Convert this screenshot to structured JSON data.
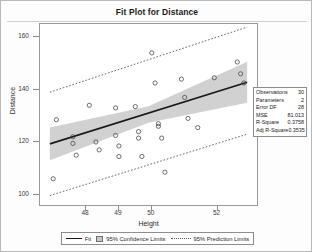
{
  "chart_data": {
    "type": "scatter",
    "title": "Fit Plot for Distance",
    "xlabel": "Height",
    "ylabel": "Distance",
    "xlim": [
      46.6,
      53.2
    ],
    "ylim": [
      96,
      165
    ],
    "xticks": [
      48,
      49,
      50,
      52
    ],
    "yticks": [
      100,
      120,
      140,
      160
    ],
    "grid": false,
    "legend_position": "bottom",
    "series": [
      {
        "name": "Observations",
        "type": "scatter",
        "marker": "open-circle",
        "points": [
          {
            "x": 47.0,
            "y": 106.0
          },
          {
            "x": 47.1,
            "y": 128.5
          },
          {
            "x": 47.6,
            "y": 122.0
          },
          {
            "x": 47.6,
            "y": 119.5
          },
          {
            "x": 47.7,
            "y": 115.0
          },
          {
            "x": 48.1,
            "y": 134.0
          },
          {
            "x": 48.3,
            "y": 120.0
          },
          {
            "x": 48.4,
            "y": 117.0
          },
          {
            "x": 48.9,
            "y": 133.0
          },
          {
            "x": 48.9,
            "y": 122.5
          },
          {
            "x": 49.0,
            "y": 118.5
          },
          {
            "x": 49.0,
            "y": 114.5
          },
          {
            "x": 49.5,
            "y": 133.5
          },
          {
            "x": 49.6,
            "y": 124.0
          },
          {
            "x": 49.6,
            "y": 121.5
          },
          {
            "x": 49.7,
            "y": 114.5
          },
          {
            "x": 50.0,
            "y": 154.0
          },
          {
            "x": 50.1,
            "y": 142.5
          },
          {
            "x": 50.2,
            "y": 127.0
          },
          {
            "x": 50.2,
            "y": 126.0
          },
          {
            "x": 50.3,
            "y": 121.5
          },
          {
            "x": 50.4,
            "y": 108.5
          },
          {
            "x": 50.9,
            "y": 144.0
          },
          {
            "x": 51.0,
            "y": 137.0
          },
          {
            "x": 51.1,
            "y": 129.0
          },
          {
            "x": 51.4,
            "y": 125.5
          },
          {
            "x": 51.9,
            "y": 144.5
          },
          {
            "x": 52.6,
            "y": 150.5
          },
          {
            "x": 52.7,
            "y": 146.0
          },
          {
            "x": 52.8,
            "y": 142.5
          }
        ]
      },
      {
        "name": "Fit",
        "type": "line",
        "style": "solid",
        "points": [
          {
            "x": 46.9,
            "y": 119.3
          },
          {
            "x": 52.9,
            "y": 142.8
          }
        ]
      },
      {
        "name": "95% Confidence Limits",
        "type": "band",
        "upper": [
          {
            "x": 46.9,
            "y": 125.5
          },
          {
            "x": 49.9,
            "y": 133.6
          },
          {
            "x": 52.9,
            "y": 150.6
          }
        ],
        "lower": [
          {
            "x": 46.9,
            "y": 113.1
          },
          {
            "x": 49.9,
            "y": 127.4
          },
          {
            "x": 52.9,
            "y": 135.0
          }
        ]
      },
      {
        "name": "95% Prediction Limits",
        "type": "band-lines",
        "style": "dotted",
        "upper": [
          {
            "x": 46.9,
            "y": 139.0
          },
          {
            "x": 52.9,
            "y": 163.8
          }
        ],
        "lower": [
          {
            "x": 46.9,
            "y": 99.6
          },
          {
            "x": 52.9,
            "y": 123.0
          }
        ]
      }
    ]
  },
  "stats": {
    "rows": [
      {
        "key": "Observations",
        "value": "30"
      },
      {
        "key": "Parameters",
        "value": "2"
      },
      {
        "key": "Error DF",
        "value": "28"
      },
      {
        "key": "MSE",
        "value": "81.013"
      },
      {
        "key": "R-Square",
        "value": "0.3758"
      },
      {
        "key": "Adj R-Square",
        "value": "0.3535"
      }
    ]
  },
  "legend": {
    "fit": "Fit",
    "confidence": "95% Confidence Limits",
    "prediction": "95% Prediction Limits"
  },
  "colors": {
    "fit_line": "#1a1a1a",
    "confidence_band": "#c9c9c9",
    "prediction_line": "#555555",
    "marker": "#4a4a4a",
    "frame": "#9a9a9a"
  }
}
